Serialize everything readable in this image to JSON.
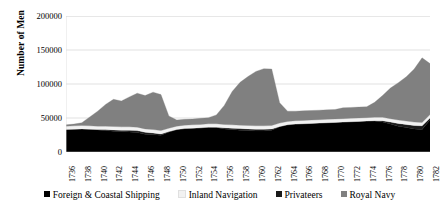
{
  "chart_data": {
    "type": "area",
    "stacked": true,
    "title": "",
    "xlabel": "",
    "ylabel": "Number of Men",
    "ylim": [
      0,
      200000
    ],
    "ytick_labels": [
      "0",
      "50000",
      "100000",
      "150000",
      "200000"
    ],
    "yticks": [
      0,
      50000,
      100000,
      150000,
      200000
    ],
    "grid": "horizontal",
    "legend_position": "bottom",
    "x": [
      1736,
      1737,
      1738,
      1739,
      1740,
      1741,
      1742,
      1743,
      1744,
      1745,
      1746,
      1747,
      1748,
      1749,
      1750,
      1751,
      1752,
      1753,
      1754,
      1755,
      1756,
      1757,
      1758,
      1759,
      1760,
      1761,
      1762,
      1763,
      1764,
      1765,
      1766,
      1767,
      1768,
      1769,
      1770,
      1771,
      1772,
      1773,
      1774,
      1775,
      1776,
      1777,
      1778,
      1779,
      1780,
      1781,
      1782
    ],
    "xtick_labels": [
      "1736",
      "1738",
      "1740",
      "1742",
      "1744",
      "1746",
      "1748",
      "1750",
      "1752",
      "1754",
      "1756",
      "1758",
      "1760",
      "1762",
      "1764",
      "1766",
      "1768",
      "1770",
      "1772",
      "1774",
      "1776",
      "1778",
      "1780",
      "1782"
    ],
    "xtick_step": 2,
    "series": [
      {
        "name": "Foreign & Coastal Shipping",
        "color": "#000000",
        "values": [
          33000,
          33500,
          34000,
          33500,
          32500,
          31500,
          30500,
          30000,
          29500,
          28500,
          26000,
          25500,
          24500,
          29500,
          33000,
          34500,
          35000,
          35500,
          36500,
          36000,
          34000,
          33000,
          32000,
          31500,
          31000,
          31000,
          32000,
          37000,
          40000,
          41000,
          41500,
          42000,
          42500,
          43000,
          43500,
          44000,
          44500,
          45000,
          45500,
          45500,
          44000,
          41000,
          38000,
          36000,
          34000,
          33000,
          47000
        ]
      },
      {
        "name": "Privateers",
        "color": "#1a1a1a",
        "values": [
          0,
          0,
          0,
          0,
          500,
          1500,
          2000,
          2000,
          2500,
          3000,
          3000,
          2500,
          2000,
          500,
          0,
          0,
          0,
          0,
          0,
          500,
          1500,
          2000,
          2500,
          2500,
          2500,
          2500,
          2000,
          500,
          0,
          0,
          0,
          0,
          0,
          0,
          0,
          0,
          0,
          0,
          0,
          500,
          2000,
          3000,
          4000,
          4500,
          5000,
          5500,
          3000
        ]
      },
      {
        "name": "Inland Navigation",
        "color": "#f2f2f2",
        "values": [
          5000,
          5000,
          5000,
          5000,
          5000,
          5000,
          5000,
          5000,
          5000,
          5000,
          5000,
          5000,
          5000,
          5000,
          5000,
          5000,
          5000,
          5000,
          5000,
          5000,
          5000,
          5000,
          5000,
          5000,
          5000,
          5000,
          5000,
          5000,
          5000,
          5000,
          5000,
          5000,
          5000,
          5000,
          5000,
          5000,
          5000,
          5000,
          5000,
          5000,
          5000,
          5000,
          5000,
          5000,
          5000,
          5000,
          5000
        ]
      },
      {
        "name": "Royal Navy",
        "color": "#808080",
        "values": [
          2000,
          2500,
          4000,
          13000,
          22000,
          32000,
          40000,
          38000,
          44000,
          50000,
          49000,
          55000,
          53000,
          18000,
          9000,
          8500,
          8500,
          9000,
          9000,
          13000,
          28000,
          49000,
          63000,
          72000,
          80000,
          84000,
          83000,
          30000,
          15000,
          14000,
          14000,
          14000,
          14000,
          14000,
          14000,
          16000,
          16000,
          16000,
          16000,
          22000,
          32000,
          45000,
          55000,
          65000,
          78000,
          95000,
          75000
        ]
      }
    ]
  },
  "legend": {
    "items": [
      {
        "label": "Foreign & Coastal Shipping",
        "color": "#000000"
      },
      {
        "label": "Inland Navigation",
        "color": "#f2f2f2"
      },
      {
        "label": "Privateers",
        "color": "#1a1a1a"
      },
      {
        "label": "Royal Navy",
        "color": "#808080"
      }
    ]
  }
}
